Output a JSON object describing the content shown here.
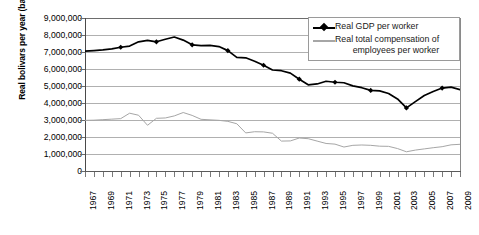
{
  "chart_data": {
    "type": "line",
    "title": "",
    "xlabel": "",
    "ylabel": "Real bolivars per year (base 1997)",
    "ylim": [
      0,
      9000000
    ],
    "xlim": [
      1967,
      2009
    ],
    "grid": true,
    "legend_position": "top-right",
    "ytick_labels": [
      "9,000,000",
      "8,000,000",
      "7,000,000",
      "6,000,000",
      "5,000,000",
      "4,000,000",
      "3,000,000",
      "2,000,000",
      "1,000,000",
      "0"
    ],
    "ytick_values": [
      9000000,
      8000000,
      7000000,
      6000000,
      5000000,
      4000000,
      3000000,
      2000000,
      1000000,
      0
    ],
    "xtick_labels": [
      "1967",
      "1969",
      "1971",
      "1973",
      "1975",
      "1977",
      "1979",
      "1981",
      "1983",
      "1985",
      "1987",
      "1989",
      "1991",
      "1993",
      "1995",
      "1997",
      "1999",
      "2001",
      "2003",
      "2005",
      "2007",
      "2009"
    ],
    "x": [
      1967,
      1968,
      1969,
      1970,
      1971,
      1972,
      1973,
      1974,
      1975,
      1976,
      1977,
      1978,
      1979,
      1980,
      1981,
      1982,
      1983,
      1984,
      1985,
      1986,
      1987,
      1988,
      1989,
      1990,
      1991,
      1992,
      1993,
      1994,
      1995,
      1996,
      1997,
      1998,
      1999,
      2000,
      2001,
      2002,
      2003,
      2004,
      2005,
      2006,
      2007,
      2008,
      2009
    ],
    "series": [
      {
        "name": "Real GDP per worker",
        "color": "#000000",
        "marker": "diamond",
        "marker_years": [
          1971,
          1975,
          1979,
          1983,
          1987,
          1991,
          1995,
          1999,
          2003,
          2007
        ],
        "values": [
          7050000,
          7080000,
          7120000,
          7180000,
          7280000,
          7350000,
          7600000,
          7680000,
          7600000,
          7750000,
          7880000,
          7700000,
          7420000,
          7380000,
          7390000,
          7320000,
          7080000,
          6680000,
          6660000,
          6460000,
          6220000,
          5940000,
          5900000,
          5760000,
          5400000,
          5070000,
          5120000,
          5280000,
          5220000,
          5190000,
          5010000,
          4900000,
          4740000,
          4710000,
          4560000,
          4240000,
          3710000,
          4080000,
          4440000,
          4680000,
          4880000,
          4930000,
          4790000
        ]
      },
      {
        "name": "Real total compensation of employees per worker",
        "color": "#a6a6a6",
        "marker": "none",
        "values": [
          2980000,
          2990000,
          3020000,
          3050000,
          3080000,
          3400000,
          3280000,
          2690000,
          3100000,
          3120000,
          3240000,
          3440000,
          3270000,
          3040000,
          3010000,
          2980000,
          2920000,
          2780000,
          2240000,
          2310000,
          2300000,
          2220000,
          1760000,
          1770000,
          1940000,
          1900000,
          1760000,
          1620000,
          1580000,
          1410000,
          1510000,
          1530000,
          1510000,
          1460000,
          1450000,
          1320000,
          1130000,
          1230000,
          1300000,
          1370000,
          1430000,
          1540000,
          1570000
        ]
      }
    ]
  },
  "legend": {
    "entries": [
      {
        "label": "Real GDP per worker",
        "label_line2": ""
      },
      {
        "label": "Real total compensation of",
        "label_line2": "employees per worker"
      }
    ]
  }
}
